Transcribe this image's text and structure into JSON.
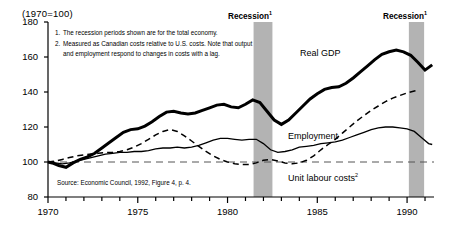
{
  "index_note": "(1970=100)",
  "notes": [
    {
      "num": "1.",
      "text": "The recession periods shown are for the total economy."
    },
    {
      "num": "2.",
      "text": "Measured as Canadian costs relative to U.S. costs. Note that output and employment respond to changes in costs with a lag."
    }
  ],
  "source": "Source: Economic Council, 1992, Figure 4, p. 4.",
  "recession_labels": {
    "first": "Recession",
    "second": "Recession",
    "superscript": "1"
  },
  "series_labels": {
    "gdp": "Real GDP",
    "employment": "Employment",
    "unit_labour_costs": "Unit labour costs",
    "ulc_superscript": "2"
  },
  "colors": {
    "line": "#000000",
    "recession_band": "#b3b3b3",
    "axis": "#000000",
    "baseline": "#555555"
  },
  "chart_data": {
    "type": "line",
    "title": "",
    "subtitle": "",
    "xlabel": "",
    "ylabel": "(1970=100)",
    "xlim": [
      1970,
      1991.5
    ],
    "ylim": [
      80,
      180
    ],
    "yticks": [
      80,
      100,
      120,
      140,
      160,
      180
    ],
    "xticks": [
      1970,
      1971,
      1972,
      1973,
      1974,
      1975,
      1976,
      1977,
      1978,
      1979,
      1980,
      1981,
      1982,
      1983,
      1984,
      1985,
      1986,
      1987,
      1988,
      1989,
      1990,
      1991
    ],
    "xtick_labels": [
      "1970",
      "",
      "",
      "",
      "",
      "1975",
      "",
      "",
      "",
      "",
      "1980",
      "",
      "",
      "",
      "",
      "1985",
      "",
      "",
      "",
      "",
      "1990",
      ""
    ],
    "grid": false,
    "legend_position": "inline-annotations",
    "reference_line": {
      "value": 100,
      "style": "dashed",
      "label": ""
    },
    "annotations": [
      {
        "text": "Recession",
        "superscript": "1",
        "x": 1981.8,
        "y": 178
      },
      {
        "text": "Recession",
        "superscript": "1",
        "x": 1990.2,
        "y": 178
      },
      {
        "text": "Real GDP",
        "x": 1984.0,
        "y": 152
      },
      {
        "text": "Employment",
        "x": 1983.3,
        "y": 122
      },
      {
        "text": "Unit labour costs",
        "superscript": "2",
        "x": 1983.3,
        "y": 98
      }
    ],
    "shaded_regions": [
      {
        "name": "recession-1",
        "x0": 1981.45,
        "x1": 1982.5,
        "color": "#b3b3b3"
      },
      {
        "name": "recession-2",
        "x0": 1990.1,
        "x1": 1990.95,
        "color": "#b3b3b3"
      }
    ],
    "series": [
      {
        "name": "Real GDP",
        "style": "thick-solid",
        "x": [
          1970.0,
          1970.3,
          1970.6,
          1971.0,
          1971.4,
          1971.8,
          1972.2,
          1972.6,
          1973.0,
          1973.4,
          1973.8,
          1974.2,
          1974.6,
          1975.0,
          1975.4,
          1975.8,
          1976.2,
          1976.6,
          1977.0,
          1977.4,
          1977.8,
          1978.2,
          1978.6,
          1979.0,
          1979.4,
          1979.8,
          1980.2,
          1980.6,
          1981.0,
          1981.4,
          1981.8,
          1982.2,
          1982.6,
          1983.0,
          1983.4,
          1983.8,
          1984.2,
          1984.6,
          1985.0,
          1985.4,
          1985.8,
          1986.2,
          1986.6,
          1987.0,
          1987.4,
          1987.8,
          1988.2,
          1988.6,
          1989.0,
          1989.4,
          1989.8,
          1990.2,
          1990.6,
          1991.0,
          1991.4
        ],
        "y": [
          100.0,
          99.2,
          98.0,
          97.0,
          99.5,
          101.5,
          103.0,
          105.0,
          108.0,
          111.0,
          114.0,
          117.0,
          118.5,
          119.0,
          120.5,
          123.0,
          126.0,
          128.5,
          129.0,
          128.0,
          127.5,
          128.0,
          129.5,
          131.0,
          132.5,
          133.0,
          131.5,
          131.0,
          133.0,
          135.5,
          134.0,
          129.0,
          124.0,
          121.5,
          124.0,
          128.0,
          132.0,
          136.0,
          139.0,
          141.5,
          142.5,
          143.0,
          145.0,
          148.0,
          151.5,
          155.0,
          158.5,
          161.5,
          163.0,
          164.0,
          163.0,
          161.0,
          157.0,
          152.5,
          155.5
        ]
      },
      {
        "name": "Employment",
        "style": "thin-solid",
        "x": [
          1970.0,
          1970.4,
          1970.8,
          1971.2,
          1971.6,
          1972.0,
          1972.4,
          1972.8,
          1973.2,
          1973.6,
          1974.0,
          1974.4,
          1974.8,
          1975.2,
          1975.6,
          1976.0,
          1976.4,
          1976.8,
          1977.2,
          1977.6,
          1978.0,
          1978.4,
          1978.8,
          1979.2,
          1979.6,
          1980.0,
          1980.4,
          1980.8,
          1981.2,
          1981.6,
          1982.0,
          1982.4,
          1982.8,
          1983.2,
          1983.6,
          1984.0,
          1984.4,
          1984.8,
          1985.2,
          1985.6,
          1986.0,
          1986.4,
          1986.8,
          1987.2,
          1987.6,
          1988.0,
          1988.4,
          1988.8,
          1989.2,
          1989.6,
          1990.0,
          1990.4,
          1990.8,
          1991.2,
          1991.4
        ],
        "y": [
          100.0,
          99.5,
          99.0,
          99.5,
          100.5,
          101.5,
          102.5,
          103.5,
          104.5,
          105.0,
          105.5,
          105.5,
          106.0,
          106.0,
          106.5,
          107.5,
          108.0,
          108.0,
          108.5,
          108.0,
          108.5,
          109.5,
          111.0,
          112.5,
          113.5,
          113.5,
          113.0,
          112.5,
          113.0,
          113.0,
          110.5,
          107.0,
          105.5,
          106.0,
          107.0,
          108.5,
          109.0,
          109.5,
          110.5,
          111.0,
          111.5,
          112.5,
          114.0,
          115.5,
          117.0,
          118.5,
          119.5,
          120.0,
          120.0,
          119.5,
          119.0,
          117.5,
          114.0,
          110.5,
          110.0
        ]
      },
      {
        "name": "Unit labour costs",
        "style": "dashed",
        "x": [
          1970.0,
          1970.4,
          1970.8,
          1971.2,
          1971.6,
          1972.0,
          1972.4,
          1972.8,
          1973.2,
          1973.6,
          1974.0,
          1974.4,
          1974.8,
          1975.2,
          1975.6,
          1976.0,
          1976.4,
          1976.8,
          1977.2,
          1977.6,
          1978.0,
          1978.4,
          1978.8,
          1979.2,
          1979.6,
          1980.0,
          1980.4,
          1980.8,
          1981.2,
          1981.6,
          1982.0,
          1982.4,
          1982.8,
          1983.2,
          1983.6,
          1984.0,
          1984.4,
          1984.8,
          1985.2,
          1985.6,
          1986.0,
          1986.4,
          1986.8,
          1987.2,
          1987.6,
          1988.0,
          1988.4,
          1988.8,
          1989.2,
          1989.6,
          1990.0,
          1990.4,
          1990.6
        ],
        "y": [
          100.0,
          100.5,
          101.5,
          102.5,
          103.5,
          104.0,
          104.5,
          105.0,
          105.5,
          105.5,
          106.0,
          107.0,
          108.5,
          110.5,
          113.0,
          115.5,
          117.5,
          118.5,
          117.5,
          115.0,
          112.0,
          109.0,
          106.0,
          103.5,
          101.5,
          100.0,
          99.0,
          98.5,
          98.5,
          99.5,
          101.0,
          101.5,
          100.5,
          99.5,
          99.0,
          99.5,
          101.0,
          103.5,
          107.0,
          110.0,
          113.0,
          116.5,
          120.0,
          123.5,
          126.5,
          129.5,
          132.0,
          134.5,
          136.5,
          138.0,
          139.5,
          140.5,
          141.0
        ]
      }
    ]
  }
}
